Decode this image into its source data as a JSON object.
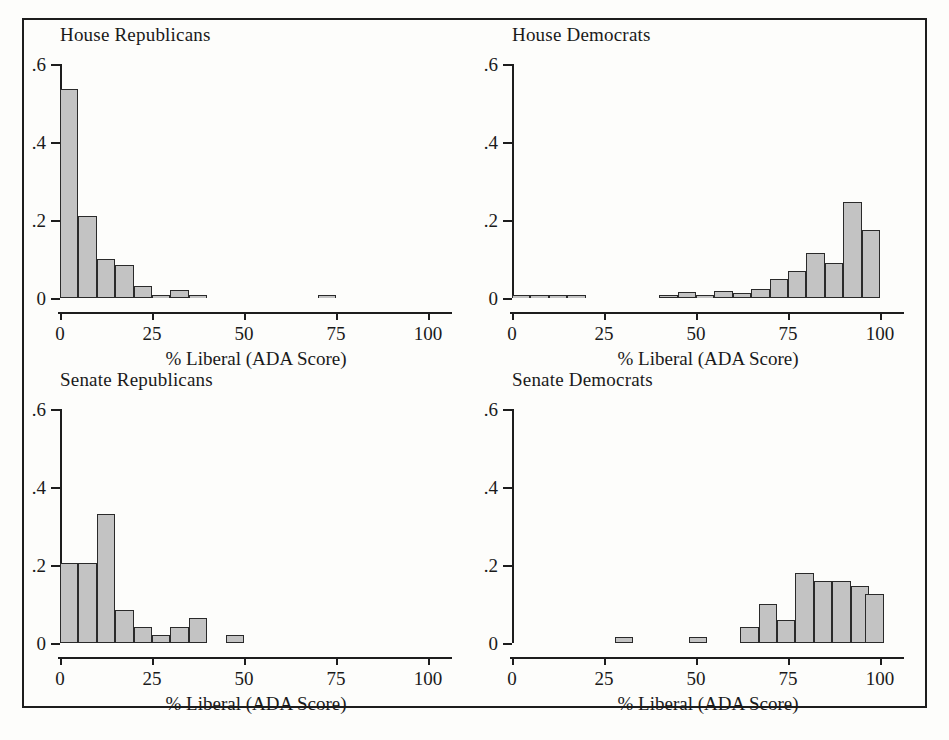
{
  "figure": {
    "xlabel": "% Liberal (ADA Score)",
    "ytick_labels": [
      "0",
      ".2",
      ".4",
      ".6"
    ],
    "ytick_values": [
      0,
      0.2,
      0.4,
      0.6
    ],
    "xtick_labels": [
      "0",
      "25",
      "50",
      "75",
      "100"
    ],
    "xtick_values": [
      0,
      25,
      50,
      75,
      100
    ],
    "bar_fill": "#c3c3c3",
    "bar_stroke": "#2a2a2a",
    "axis_color": "#1d1d1d",
    "frame_color": "#1d1d1d",
    "background": "#fdfdfb"
  },
  "chart_data": [
    {
      "type": "bar",
      "title": "House Republicans",
      "xlabel": "% Liberal (ADA Score)",
      "ylabel": "",
      "xlim": [
        0,
        100
      ],
      "ylim": [
        0,
        0.6
      ],
      "grid": false,
      "legend": "none",
      "bin_width": 5,
      "bin_starts": [
        0,
        5,
        10,
        15,
        20,
        25,
        30,
        35,
        70
      ],
      "values": [
        0.535,
        0.21,
        0.1,
        0.085,
        0.03,
        0.003,
        0.02,
        0.003,
        0.004
      ]
    },
    {
      "type": "bar",
      "title": "House Democrats",
      "xlabel": "% Liberal (ADA Score)",
      "ylabel": "",
      "xlim": [
        0,
        100
      ],
      "ylim": [
        0,
        0.6
      ],
      "grid": false,
      "legend": "none",
      "bin_width": 5,
      "bin_starts": [
        0,
        5,
        10,
        15,
        40,
        45,
        50,
        55,
        60,
        65,
        70,
        75,
        80,
        85,
        90,
        95
      ],
      "values": [
        0.003,
        0.003,
        0.003,
        0.003,
        0.008,
        0.015,
        0.004,
        0.019,
        0.012,
        0.022,
        0.05,
        0.07,
        0.115,
        0.09,
        0.245,
        0.175
      ]
    },
    {
      "type": "bar",
      "title": "Senate Republicans",
      "xlabel": "% Liberal (ADA Score)",
      "ylabel": "",
      "xlim": [
        0,
        100
      ],
      "ylim": [
        0,
        0.6
      ],
      "grid": false,
      "legend": "none",
      "bin_width": 5,
      "bin_starts": [
        0,
        5,
        10,
        15,
        20,
        25,
        30,
        35,
        45
      ],
      "values": [
        0.205,
        0.205,
        0.33,
        0.085,
        0.04,
        0.02,
        0.04,
        0.065,
        0.02
      ]
    },
    {
      "type": "bar",
      "title": "Senate Democrats",
      "xlabel": "% Liberal (ADA Score)",
      "ylabel": "",
      "xlim": [
        0,
        100
      ],
      "ylim": [
        0,
        0.6
      ],
      "grid": false,
      "legend": "none",
      "bin_width": 5,
      "bin_starts": [
        28,
        48,
        62,
        67,
        72,
        77,
        82,
        87,
        92,
        96
      ],
      "values": [
        0.016,
        0.016,
        0.04,
        0.1,
        0.06,
        0.18,
        0.16,
        0.16,
        0.145,
        0.125
      ]
    }
  ]
}
